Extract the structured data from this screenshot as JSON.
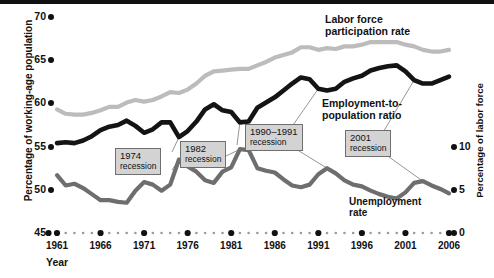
{
  "figure": {
    "axis_left_title": "Percentage of working-age population",
    "axis_right_title": "Percentage of labor force",
    "axis_x_title": "Year"
  },
  "series_labels": {
    "lfpr_line1": "Labor force",
    "lfpr_line2": "participation rate",
    "epop_line1": "Employment-to-",
    "epop_line2": "population ratio",
    "unemp_line1": "Unemployment",
    "unemp_line2": "rate"
  },
  "callouts": [
    {
      "id": "c1974",
      "year": "1974",
      "word": "recession"
    },
    {
      "id": "c1982",
      "year": "1982",
      "word": "recession"
    },
    {
      "id": "c1990",
      "year": "1990–1991",
      "word": "recession"
    },
    {
      "id": "c2001",
      "year": "2001",
      "word": "recession"
    }
  ],
  "ticks": {
    "left": [
      "70",
      "65",
      "60",
      "55",
      "50",
      "45"
    ],
    "right": [
      "10",
      "5",
      "0"
    ],
    "x": [
      "1961",
      "1966",
      "1971",
      "1976",
      "1981",
      "1986",
      "1991",
      "1996",
      "2001",
      "2006"
    ]
  },
  "colors": {
    "lfpr": "#bcbcbc",
    "epop": "#141414",
    "unemp": "#6e6e6e",
    "callout_fill": "#d3d3d3",
    "callout_border": "#6f6f6f",
    "axis": "#111111",
    "background": "#ffffff"
  },
  "chart_data": {
    "type": "line",
    "title": "",
    "xlabel": "Year",
    "ylabel": "Percentage of working-age population",
    "ylabel_right": "Percentage of labor force",
    "xlim": [
      1961,
      2006
    ],
    "ylim": [
      45,
      70
    ],
    "ylim_right": [
      0,
      10
    ],
    "grid": false,
    "legend": "inline annotations on lines",
    "x": [
      1961,
      1962,
      1963,
      1964,
      1965,
      1966,
      1967,
      1968,
      1969,
      1970,
      1971,
      1972,
      1973,
      1974,
      1975,
      1976,
      1977,
      1978,
      1979,
      1980,
      1981,
      1982,
      1983,
      1984,
      1985,
      1986,
      1987,
      1988,
      1989,
      1990,
      1991,
      1992,
      1993,
      1994,
      1995,
      1996,
      1997,
      1998,
      1999,
      2000,
      2001,
      2002,
      2003,
      2004,
      2005,
      2006
    ],
    "series": [
      {
        "name": "Labor force participation rate",
        "axis": "left",
        "color": "#bcbcbc",
        "values": [
          59.3,
          58.8,
          58.7,
          58.7,
          58.9,
          59.2,
          59.6,
          59.6,
          60.1,
          60.4,
          60.2,
          60.4,
          60.8,
          61.3,
          61.2,
          61.6,
          62.3,
          63.2,
          63.7,
          63.8,
          63.9,
          64.0,
          64.0,
          64.4,
          64.8,
          65.3,
          65.6,
          65.9,
          66.5,
          66.5,
          66.2,
          66.4,
          66.3,
          66.6,
          66.6,
          66.8,
          67.1,
          67.1,
          67.1,
          67.1,
          66.8,
          66.6,
          66.2,
          66.0,
          66.0,
          66.2
        ]
      },
      {
        "name": "Employment-to-population ratio",
        "axis": "left",
        "color": "#141414",
        "values": [
          55.4,
          55.5,
          55.4,
          55.7,
          56.2,
          56.9,
          57.3,
          57.5,
          58.0,
          57.4,
          56.6,
          57.0,
          57.8,
          57.8,
          56.1,
          56.8,
          57.9,
          59.3,
          59.9,
          59.2,
          59.0,
          57.8,
          57.9,
          59.5,
          60.1,
          60.7,
          61.5,
          62.3,
          63.0,
          62.8,
          61.7,
          61.5,
          61.7,
          62.5,
          62.9,
          63.2,
          63.8,
          64.1,
          64.3,
          64.4,
          63.7,
          62.7,
          62.3,
          62.3,
          62.7,
          63.1
        ]
      },
      {
        "name": "Unemployment rate",
        "axis": "right",
        "color": "#6e6e6e",
        "values": [
          6.7,
          5.5,
          5.7,
          5.2,
          4.5,
          3.8,
          3.8,
          3.6,
          3.5,
          4.9,
          5.9,
          5.6,
          4.9,
          5.6,
          8.5,
          7.7,
          7.1,
          6.1,
          5.8,
          7.1,
          7.6,
          9.7,
          9.6,
          7.5,
          7.2,
          7.0,
          6.2,
          5.5,
          5.3,
          5.6,
          6.8,
          7.5,
          6.9,
          6.1,
          5.6,
          5.4,
          4.9,
          4.5,
          4.2,
          4.0,
          4.7,
          5.8,
          6.0,
          5.5,
          5.1,
          4.6
        ]
      }
    ],
    "annotations": [
      {
        "text": "1974 recession",
        "x": 1974
      },
      {
        "text": "1982 recession",
        "x": 1982
      },
      {
        "text": "1990–1991 recession",
        "x": 1991
      },
      {
        "text": "2001 recession",
        "x": 2001
      }
    ]
  }
}
